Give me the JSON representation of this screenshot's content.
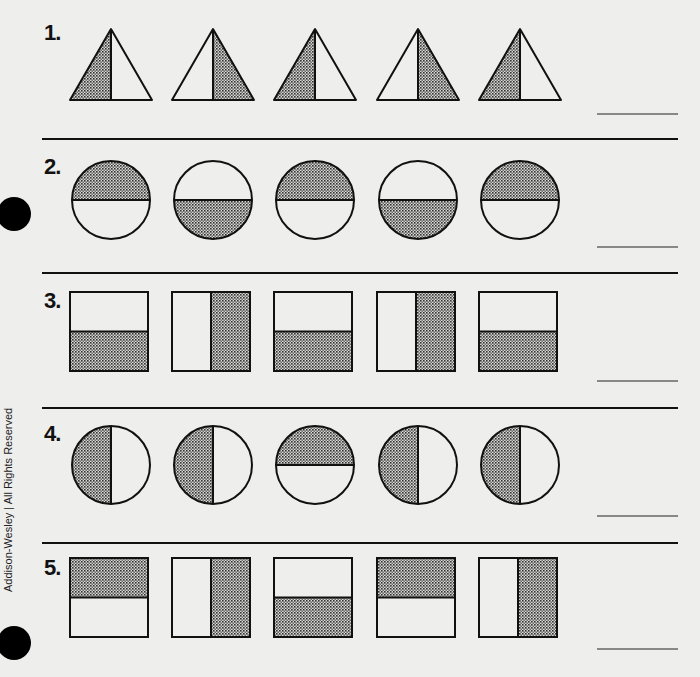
{
  "worksheet": {
    "side_credit": "Addison-Wesley  |  All Rights Reserved",
    "colors": {
      "ink": "#111111",
      "paper": "#eeeeec",
      "shade": "#8a8a8a"
    },
    "problems": [
      {
        "number": "1.",
        "shape": "triangle",
        "items": [
          {
            "split": "vertical",
            "shaded": "left"
          },
          {
            "split": "vertical",
            "shaded": "right"
          },
          {
            "split": "vertical",
            "shaded": "left"
          },
          {
            "split": "vertical",
            "shaded": "right"
          },
          {
            "split": "vertical",
            "shaded": "left"
          }
        ],
        "answer": ""
      },
      {
        "number": "2.",
        "shape": "circle",
        "items": [
          {
            "split": "horizontal",
            "shaded": "top"
          },
          {
            "split": "horizontal",
            "shaded": "bottom"
          },
          {
            "split": "horizontal",
            "shaded": "top"
          },
          {
            "split": "horizontal",
            "shaded": "bottom"
          },
          {
            "split": "horizontal",
            "shaded": "top"
          }
        ],
        "answer": ""
      },
      {
        "number": "3.",
        "shape": "rectangle",
        "items": [
          {
            "split": "horizontal",
            "shaded": "bottom"
          },
          {
            "split": "vertical",
            "shaded": "right"
          },
          {
            "split": "horizontal",
            "shaded": "bottom"
          },
          {
            "split": "vertical",
            "shaded": "right"
          },
          {
            "split": "horizontal",
            "shaded": "bottom"
          }
        ],
        "answer": ""
      },
      {
        "number": "4.",
        "shape": "circle",
        "items": [
          {
            "split": "vertical",
            "shaded": "left"
          },
          {
            "split": "vertical",
            "shaded": "left"
          },
          {
            "split": "horizontal",
            "shaded": "top"
          },
          {
            "split": "vertical",
            "shaded": "left"
          },
          {
            "split": "vertical",
            "shaded": "left"
          }
        ],
        "answer": ""
      },
      {
        "number": "5.",
        "shape": "rectangle",
        "items": [
          {
            "split": "horizontal",
            "shaded": "top"
          },
          {
            "split": "vertical",
            "shaded": "right"
          },
          {
            "split": "horizontal",
            "shaded": "bottom"
          },
          {
            "split": "horizontal",
            "shaded": "top"
          },
          {
            "split": "vertical",
            "shaded": "right"
          }
        ],
        "answer": ""
      }
    ]
  }
}
